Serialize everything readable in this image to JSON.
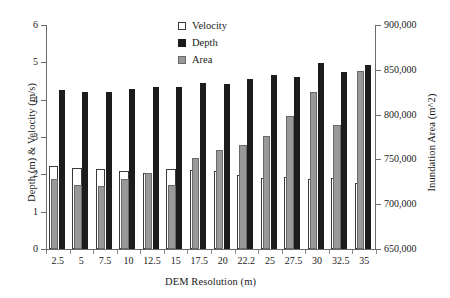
{
  "chart_data": {
    "type": "bar",
    "title": "",
    "xlabel": "DEM Resolution (m)",
    "ylabel": "Depth (m) & Velocity (m/s)",
    "y2label": "Inundation Area (m^2)",
    "grid": false,
    "legend_position": "top-center",
    "categories": [
      "2.5",
      "5",
      "7.5",
      "10",
      "12.5",
      "15",
      "17.5",
      "20",
      "22.2",
      "25",
      "27.5",
      "30",
      "32.5",
      "35"
    ],
    "ylim": [
      0,
      6
    ],
    "yticks": [
      "0",
      "1",
      "2",
      "3",
      "4",
      "5",
      "6"
    ],
    "y2lim": [
      650000,
      900000
    ],
    "y2ticks": [
      "650,000",
      "700,000",
      "750,000",
      "800,000",
      "850,000",
      "900,000"
    ],
    "series": [
      {
        "name": "Velocity",
        "axis": "left",
        "unit": "m/s",
        "color": "#ffffff",
        "edge_color": "#3a3a3a",
        "values": [
          2.22,
          2.17,
          2.15,
          2.08,
          2.03,
          2.15,
          2.11,
          2.1,
          1.98,
          1.9,
          1.92,
          1.87,
          1.89,
          1.76
        ]
      },
      {
        "name": "Depth",
        "axis": "left",
        "unit": "m",
        "color": "#1c1c1c",
        "edge_color": "#1c1c1c",
        "values": [
          4.25,
          4.2,
          4.2,
          4.28,
          4.35,
          4.33,
          4.44,
          4.41,
          4.55,
          4.66,
          4.6,
          4.98,
          4.74,
          4.92
        ]
      },
      {
        "name": "Area",
        "axis": "right",
        "unit": "m^2",
        "color": "#999999",
        "edge_color": "#6a6a6a",
        "values": [
          728000,
          722000,
          720000,
          728000,
          735000,
          722000,
          752000,
          760000,
          766000,
          776000,
          799000,
          825000,
          788000,
          849000
        ]
      }
    ]
  },
  "legend": {
    "items": [
      {
        "label": "Velocity",
        "swatch": "velocity-swatch"
      },
      {
        "label": "Depth",
        "swatch": "depth-swatch"
      },
      {
        "label": "Area",
        "swatch": "area-swatch"
      }
    ]
  },
  "axes": {
    "left_title": "Depth (m) & Velocity (m/s)",
    "right_title": "Inundation Area (m^2)",
    "bottom_title": "DEM Resolution (m)"
  }
}
